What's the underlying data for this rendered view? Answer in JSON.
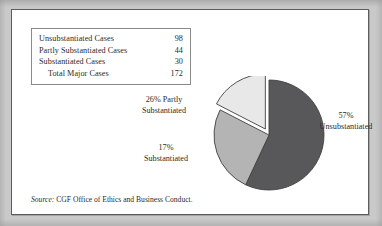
{
  "figure": {
    "background_color": "#c9c9c9",
    "panel_color": "#ffffff",
    "panel_border_color": "#5d5d5d"
  },
  "table": {
    "border_color": "#8a8a8a",
    "rows": [
      {
        "label": "Unsubstantiated Cases",
        "value": "98",
        "is_total": false
      },
      {
        "label": "Partly Substantiated Cases",
        "value": "44",
        "is_total": false
      },
      {
        "label": "Substantiated Cases",
        "value": "30",
        "is_total": false
      },
      {
        "label": "Total Major Cases",
        "value": "172",
        "is_total": true
      }
    ]
  },
  "labels": {
    "unsubstantiated": {
      "line1": "57%",
      "line2": "Unsubstantiated"
    },
    "partly": {
      "line1": "26% Partly",
      "line2": "Substantiated"
    },
    "substantiated": {
      "line1": "17%",
      "line2": "Substantiated"
    }
  },
  "source": {
    "lead": "Source:",
    "text": " CGF Office of Ethics and Business Conduct."
  },
  "chart_data": {
    "type": "pie",
    "title": "",
    "categories": [
      "Unsubstantiated",
      "Partly Substantiated",
      "Substantiated"
    ],
    "values": [
      98,
      44,
      30
    ],
    "percentages": [
      57,
      26,
      17
    ],
    "total": 172,
    "total_label": "Total Major Cases",
    "colors": [
      "#58585a",
      "#b4b4b4",
      "#e8e8e8"
    ],
    "slice_outline_color": "#3f3f3f",
    "start_angle_deg": 0,
    "direction": "clockwise",
    "exploded_slices": [
      "Substantiated"
    ],
    "legend": "none",
    "data_labels": [
      "57% Unsubstantiated",
      "26% Partly Substantiated",
      "17% Substantiated"
    ]
  }
}
